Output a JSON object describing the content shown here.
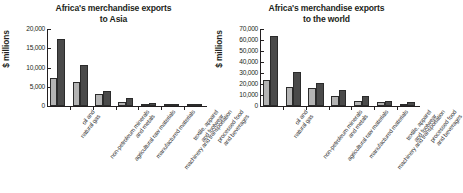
{
  "chart_data": [
    {
      "type": "bar",
      "title": "Africa's merchandise exports to Asia",
      "title_line1": "Africa's merchandise exports",
      "title_line2": "to Asia",
      "ylabel": "$ millions",
      "xlabel": "",
      "ylim": [
        0,
        20000
      ],
      "yticks": [
        "0",
        "5,000",
        "10,000",
        "15,000",
        "20,000"
      ],
      "ytick_values": [
        0,
        5000,
        10000,
        15000,
        20000
      ],
      "grid": false,
      "legend": "none",
      "categories": [
        "oil and natural gas",
        "non-petroleum minerals and metals",
        "agricultural raw materials",
        "manufactured materials",
        "machinery and transportation",
        "textile, apparel and footwear",
        "processed food and beverages"
      ],
      "series": [
        {
          "name": "series-a",
          "color": "#b4b4b4",
          "values": [
            7200,
            6300,
            3100,
            1000,
            500,
            300,
            200
          ]
        },
        {
          "name": "series-b",
          "color": "#4a4a4a",
          "values": [
            17500,
            10600,
            3950,
            2000,
            900,
            600,
            350
          ]
        }
      ]
    },
    {
      "type": "bar",
      "title": "Africa's merchandise exports to the world",
      "title_line1": "Africa's merchandise exports",
      "title_line2": "to the world",
      "ylabel": "$ millions",
      "xlabel": "",
      "ylim": [
        0,
        70000
      ],
      "yticks": [
        "0",
        "10,000",
        "20,000",
        "30,000",
        "40,000",
        "50,000",
        "60,000",
        "70,000"
      ],
      "ytick_values": [
        0,
        10000,
        20000,
        30000,
        40000,
        50000,
        60000,
        70000
      ],
      "grid": false,
      "legend": "none",
      "categories": [
        "oil and natural gas",
        "non-petroleum minerals and metals",
        "agricultural raw materials",
        "manufactured materials",
        "machinery and transportation",
        "textile, apparel and footwear",
        "processed food and beverages"
      ],
      "series": [
        {
          "name": "series-a",
          "color": "#b4b4b4",
          "values": [
            24000,
            17000,
            16800,
            9500,
            4200,
            4000,
            1500
          ]
        },
        {
          "name": "series-b",
          "color": "#4a4a4a",
          "values": [
            64000,
            30500,
            21000,
            14500,
            9500,
            5000,
            3200
          ]
        }
      ]
    }
  ]
}
